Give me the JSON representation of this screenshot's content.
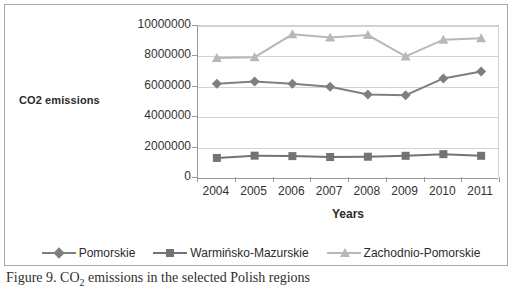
{
  "figure": {
    "caption_prefix": "Figure 9. CO",
    "caption_sub": "2",
    "caption_rest": " emissions in the selected Polish regions"
  },
  "chart_data": {
    "type": "line",
    "title": "",
    "xlabel": "Years",
    "ylabel": "CO2 emissions",
    "categories": [
      "2004",
      "2005",
      "2006",
      "2007",
      "2008",
      "2009",
      "2010",
      "2011"
    ],
    "ylim": [
      0,
      10000000
    ],
    "ytick_labels": [
      "0",
      "2000000",
      "4000000",
      "6000000",
      "8000000",
      "10000000"
    ],
    "ytick_values": [
      0,
      2000000,
      4000000,
      6000000,
      8000000,
      10000000
    ],
    "grid": true,
    "legend_position": "bottom",
    "series": [
      {
        "name": "Pomorskie",
        "color": "#7f7f7f",
        "marker": "diamond",
        "values": [
          6200000,
          6350000,
          6200000,
          6000000,
          5500000,
          5450000,
          6550000,
          7000000
        ]
      },
      {
        "name": "Warmińsko-Mazurskie",
        "color": "#737373",
        "marker": "square",
        "values": [
          1320000,
          1470000,
          1440000,
          1380000,
          1400000,
          1460000,
          1570000,
          1460000
        ]
      },
      {
        "name": "Zachodnio-Pomorskie",
        "color": "#b8b8b8",
        "marker": "triangle",
        "values": [
          7900000,
          7950000,
          9450000,
          9250000,
          9400000,
          8000000,
          9100000,
          9200000
        ]
      }
    ]
  },
  "colors": {
    "axis": "#9a9a9a",
    "grid": "#d3d3d3",
    "frame": "#a9a9a9",
    "text": "#333333"
  }
}
